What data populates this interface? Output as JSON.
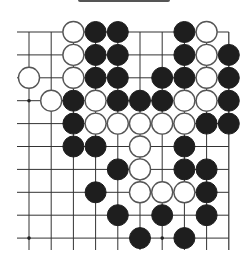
{
  "board": {
    "columns": 10,
    "rows": 10,
    "origin_x": 29,
    "origin_y": 32,
    "spacing_x": 22.2,
    "spacing_y": 22.9,
    "stone_radius": 10.5,
    "edges": {
      "top": true,
      "right": true,
      "left": false,
      "bottom": false
    },
    "colors": {
      "black": "#1e1e1e",
      "white": "#ffffff",
      "line": "#333333"
    },
    "star_points": [
      [
        0,
        3
      ],
      [
        0,
        9
      ],
      [
        6,
        9
      ]
    ],
    "stones": [
      {
        "col": 2,
        "row": 0,
        "color": "white"
      },
      {
        "col": 3,
        "row": 0,
        "color": "black"
      },
      {
        "col": 4,
        "row": 0,
        "color": "black"
      },
      {
        "col": 7,
        "row": 0,
        "color": "black"
      },
      {
        "col": 8,
        "row": 0,
        "color": "white"
      },
      {
        "col": 2,
        "row": 1,
        "color": "white"
      },
      {
        "col": 3,
        "row": 1,
        "color": "black"
      },
      {
        "col": 4,
        "row": 1,
        "color": "black"
      },
      {
        "col": 7,
        "row": 1,
        "color": "black"
      },
      {
        "col": 8,
        "row": 1,
        "color": "white"
      },
      {
        "col": 9,
        "row": 1,
        "color": "black"
      },
      {
        "col": 0,
        "row": 2,
        "color": "white"
      },
      {
        "col": 2,
        "row": 2,
        "color": "white"
      },
      {
        "col": 3,
        "row": 2,
        "color": "black"
      },
      {
        "col": 4,
        "row": 2,
        "color": "black"
      },
      {
        "col": 6,
        "row": 2,
        "color": "black"
      },
      {
        "col": 7,
        "row": 2,
        "color": "black"
      },
      {
        "col": 8,
        "row": 2,
        "color": "white"
      },
      {
        "col": 9,
        "row": 2,
        "color": "black"
      },
      {
        "col": 1,
        "row": 3,
        "color": "white"
      },
      {
        "col": 2,
        "row": 3,
        "color": "black"
      },
      {
        "col": 3,
        "row": 3,
        "color": "white"
      },
      {
        "col": 4,
        "row": 3,
        "color": "black"
      },
      {
        "col": 5,
        "row": 3,
        "color": "black"
      },
      {
        "col": 6,
        "row": 3,
        "color": "black"
      },
      {
        "col": 7,
        "row": 3,
        "color": "white"
      },
      {
        "col": 8,
        "row": 3,
        "color": "white"
      },
      {
        "col": 9,
        "row": 3,
        "color": "black"
      },
      {
        "col": 2,
        "row": 4,
        "color": "black"
      },
      {
        "col": 3,
        "row": 4,
        "color": "white"
      },
      {
        "col": 4,
        "row": 4,
        "color": "white"
      },
      {
        "col": 5,
        "row": 4,
        "color": "white"
      },
      {
        "col": 6,
        "row": 4,
        "color": "white"
      },
      {
        "col": 7,
        "row": 4,
        "color": "white"
      },
      {
        "col": 8,
        "row": 4,
        "color": "black"
      },
      {
        "col": 9,
        "row": 4,
        "color": "black"
      },
      {
        "col": 2,
        "row": 5,
        "color": "black"
      },
      {
        "col": 3,
        "row": 5,
        "color": "black"
      },
      {
        "col": 5,
        "row": 5,
        "color": "white"
      },
      {
        "col": 7,
        "row": 5,
        "color": "black"
      },
      {
        "col": 4,
        "row": 6,
        "color": "black"
      },
      {
        "col": 5,
        "row": 6,
        "color": "white"
      },
      {
        "col": 7,
        "row": 6,
        "color": "black"
      },
      {
        "col": 8,
        "row": 6,
        "color": "black"
      },
      {
        "col": 3,
        "row": 7,
        "color": "black"
      },
      {
        "col": 5,
        "row": 7,
        "color": "white"
      },
      {
        "col": 6,
        "row": 7,
        "color": "white"
      },
      {
        "col": 7,
        "row": 7,
        "color": "white"
      },
      {
        "col": 8,
        "row": 7,
        "color": "black"
      },
      {
        "col": 4,
        "row": 8,
        "color": "black"
      },
      {
        "col": 6,
        "row": 8,
        "color": "black"
      },
      {
        "col": 8,
        "row": 8,
        "color": "black"
      },
      {
        "col": 5,
        "row": 9,
        "color": "black"
      },
      {
        "col": 7,
        "row": 9,
        "color": "black"
      }
    ]
  }
}
